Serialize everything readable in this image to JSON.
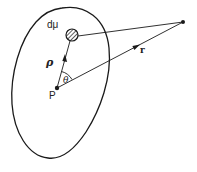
{
  "figure": {
    "labels": {
      "mass_element": "dμ",
      "position_vector": "ρ",
      "distance_vector": "r",
      "angle": "θ",
      "origin_point": "P"
    },
    "caption": ""
  },
  "colors": {
    "stroke": "#1a1a1a",
    "background": "#ffffff"
  }
}
